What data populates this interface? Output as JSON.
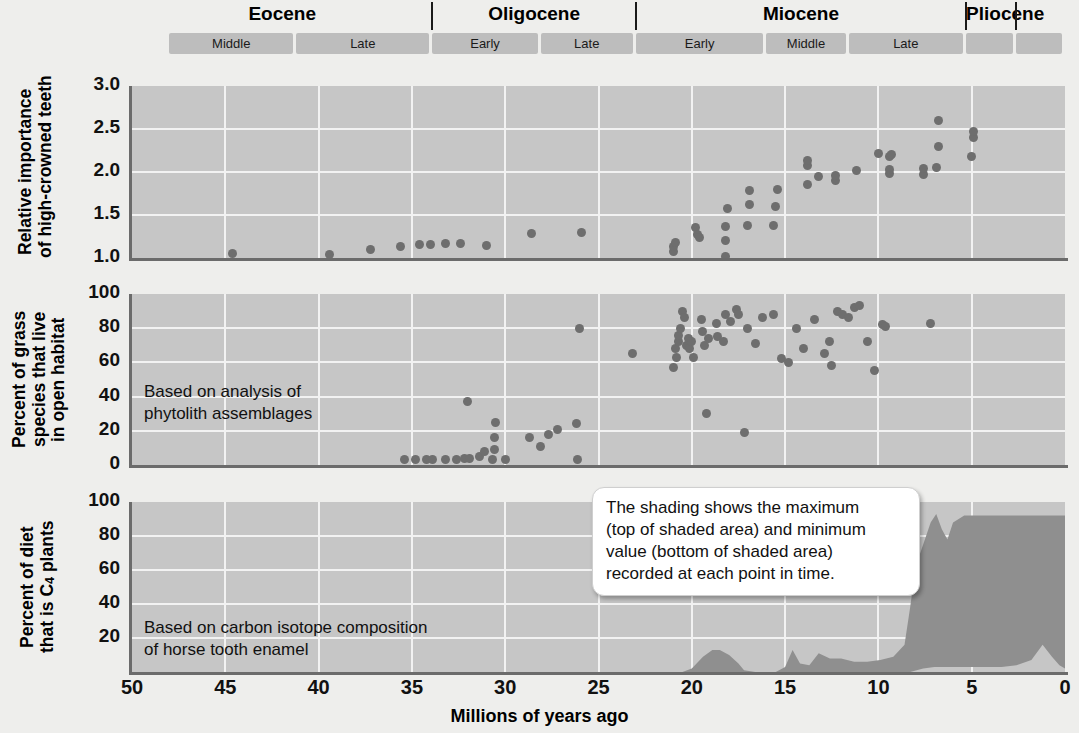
{
  "figure": {
    "x_axis_title": "Millions of years ago",
    "x_ticks": [
      50,
      45,
      40,
      35,
      30,
      25,
      20,
      15,
      10,
      5,
      0
    ],
    "x_range_ma": [
      50,
      0
    ],
    "colors": {
      "panel_fill": "#c6c6c6",
      "grid": "#f2f2f2",
      "dot": "#6e6e6e",
      "area_fill": "#8f8f8f",
      "epoch_band": "#bdbdbd",
      "page_background": "#eeeeec"
    }
  },
  "timescale": {
    "epochs": [
      {
        "name": "Eocene",
        "start_ma": 50,
        "end_ma": 33.9
      },
      {
        "name": "Oligocene",
        "start_ma": 33.9,
        "end_ma": 23.0
      },
      {
        "name": "Miocene",
        "start_ma": 23.0,
        "end_ma": 5.3
      },
      {
        "name": "Pliocene",
        "start_ma": 5.3,
        "end_ma": 2.6
      }
    ],
    "ages": [
      {
        "label": "Middle",
        "start_ma": 48.0,
        "end_ma": 41.2,
        "epoch": "Eocene"
      },
      {
        "label": "Late",
        "start_ma": 41.2,
        "end_ma": 33.9,
        "epoch": "Eocene"
      },
      {
        "label": "Early",
        "start_ma": 33.9,
        "end_ma": 28.1,
        "epoch": "Oligocene"
      },
      {
        "label": "Late",
        "start_ma": 28.1,
        "end_ma": 23.0,
        "epoch": "Oligocene"
      },
      {
        "label": "Early",
        "start_ma": 23.0,
        "end_ma": 16.0,
        "epoch": "Miocene"
      },
      {
        "label": "Middle",
        "start_ma": 16.0,
        "end_ma": 11.6,
        "epoch": "Miocene"
      },
      {
        "label": "Late",
        "start_ma": 11.6,
        "end_ma": 5.3,
        "epoch": "Miocene"
      },
      {
        "label": "",
        "start_ma": 5.3,
        "end_ma": 2.6,
        "epoch": "Pliocene"
      },
      {
        "label": "",
        "start_ma": 2.6,
        "end_ma": 0.0,
        "epoch": "Pleistocene"
      }
    ]
  },
  "panels": [
    {
      "id": "hypsodonty",
      "y_title": "Relative importance\nof high-crowned teeth",
      "y_ticks": [
        "3.0",
        "2.5",
        "2.0",
        "1.5",
        "1.0"
      ],
      "y_values": [
        3.0,
        2.5,
        2.0,
        1.5,
        1.0
      ],
      "y_range": [
        1.0,
        3.0
      ],
      "note": ""
    },
    {
      "id": "open-habitat-grass",
      "y_title": "Percent of grass\nspecies that live\nin open habitat",
      "y_ticks": [
        "100",
        "80",
        "60",
        "40",
        "20",
        "0"
      ],
      "y_values": [
        100,
        80,
        60,
        40,
        20,
        0
      ],
      "y_range": [
        0,
        100
      ],
      "note": "Based on analysis of\nphytolith assemblages"
    },
    {
      "id": "c4-diet",
      "y_title_html": "Percent of diet\nthat is C4 plants",
      "y_ticks": [
        "100",
        "80",
        "60",
        "40",
        "20"
      ],
      "y_values": [
        100,
        80,
        60,
        40,
        20
      ],
      "y_range": [
        0,
        100
      ],
      "note": "Based on carbon isotope composition\nof horse tooth enamel"
    }
  ],
  "callout": {
    "text": "The shading shows the maximum\n(top of shaded area) and minimum\nvalue (bottom of shaded area)\nrecorded at each point in time."
  },
  "chart_data": [
    {
      "type": "scatter",
      "title": "Relative importance of high-crowned teeth",
      "xlabel": "Millions of years ago",
      "ylabel": "Relative importance of high-crowned teeth",
      "xlim": [
        50,
        0
      ],
      "ylim": [
        1.0,
        3.0
      ],
      "grid": true,
      "points": [
        [
          44.6,
          1.05
        ],
        [
          39.4,
          1.04
        ],
        [
          37.2,
          1.1
        ],
        [
          35.6,
          1.13
        ],
        [
          34.6,
          1.16
        ],
        [
          34.0,
          1.16
        ],
        [
          33.2,
          1.17
        ],
        [
          32.4,
          1.17
        ],
        [
          31.0,
          1.14
        ],
        [
          28.6,
          1.28
        ],
        [
          25.9,
          1.3
        ],
        [
          21.0,
          1.08
        ],
        [
          21.0,
          1.13
        ],
        [
          20.9,
          1.18
        ],
        [
          19.8,
          1.35
        ],
        [
          19.7,
          1.27
        ],
        [
          19.6,
          1.24
        ],
        [
          18.2,
          1.02
        ],
        [
          18.2,
          1.2
        ],
        [
          18.2,
          1.37
        ],
        [
          18.1,
          1.58
        ],
        [
          17.0,
          1.38
        ],
        [
          16.9,
          1.62
        ],
        [
          16.9,
          1.78
        ],
        [
          15.6,
          1.38
        ],
        [
          15.5,
          1.6
        ],
        [
          15.4,
          1.8
        ],
        [
          13.8,
          1.85
        ],
        [
          13.8,
          2.08
        ],
        [
          13.8,
          2.13
        ],
        [
          13.2,
          1.95
        ],
        [
          12.3,
          1.9
        ],
        [
          12.3,
          1.96
        ],
        [
          11.2,
          2.02
        ],
        [
          10.0,
          2.22
        ],
        [
          9.4,
          1.98
        ],
        [
          9.4,
          2.03
        ],
        [
          9.4,
          2.18
        ],
        [
          9.3,
          2.2
        ],
        [
          7.6,
          1.97
        ],
        [
          7.6,
          2.04
        ],
        [
          6.9,
          2.05
        ],
        [
          6.8,
          2.3
        ],
        [
          6.8,
          2.6
        ],
        [
          5.0,
          2.18
        ],
        [
          4.9,
          2.4
        ],
        [
          4.9,
          2.47
        ]
      ]
    },
    {
      "type": "scatter",
      "title": "Percent of grass species that live in open habitat",
      "xlabel": "Millions of years ago",
      "ylabel": "Percent of grass species that live in open habitat",
      "xlim": [
        50,
        0
      ],
      "ylim": [
        0,
        100
      ],
      "grid": true,
      "annotation": "Based on analysis of phytolith assemblages",
      "points": [
        [
          35.4,
          3
        ],
        [
          34.8,
          3
        ],
        [
          34.2,
          3
        ],
        [
          33.9,
          3
        ],
        [
          33.2,
          3
        ],
        [
          32.6,
          3
        ],
        [
          32.2,
          4
        ],
        [
          31.9,
          4
        ],
        [
          31.4,
          5
        ],
        [
          31.1,
          8
        ],
        [
          32.0,
          37
        ],
        [
          30.7,
          3
        ],
        [
          30.6,
          9
        ],
        [
          30.6,
          16
        ],
        [
          30.5,
          25
        ],
        [
          30.0,
          3
        ],
        [
          28.7,
          16
        ],
        [
          28.1,
          11
        ],
        [
          27.7,
          18
        ],
        [
          27.2,
          21
        ],
        [
          26.2,
          24
        ],
        [
          26.1,
          3
        ],
        [
          26.0,
          80
        ],
        [
          23.2,
          65
        ],
        [
          21.0,
          57
        ],
        [
          20.9,
          68
        ],
        [
          20.8,
          63
        ],
        [
          20.7,
          72
        ],
        [
          20.7,
          76
        ],
        [
          20.6,
          80
        ],
        [
          20.5,
          90
        ],
        [
          20.4,
          86
        ],
        [
          20.3,
          70
        ],
        [
          20.2,
          74
        ],
        [
          20.1,
          68
        ],
        [
          20.0,
          72
        ],
        [
          19.9,
          63
        ],
        [
          19.5,
          85
        ],
        [
          19.4,
          78
        ],
        [
          19.3,
          70
        ],
        [
          19.2,
          30
        ],
        [
          19.1,
          74
        ],
        [
          18.7,
          83
        ],
        [
          18.6,
          75
        ],
        [
          18.3,
          72
        ],
        [
          18.2,
          88
        ],
        [
          17.9,
          84
        ],
        [
          17.6,
          91
        ],
        [
          17.5,
          88
        ],
        [
          17.2,
          19
        ],
        [
          17.0,
          80
        ],
        [
          16.6,
          71
        ],
        [
          16.2,
          86
        ],
        [
          15.6,
          88
        ],
        [
          15.2,
          62
        ],
        [
          14.8,
          60
        ],
        [
          14.4,
          80
        ],
        [
          14.0,
          68
        ],
        [
          13.4,
          85
        ],
        [
          12.9,
          65
        ],
        [
          12.6,
          72
        ],
        [
          12.5,
          58
        ],
        [
          12.2,
          90
        ],
        [
          11.9,
          88
        ],
        [
          11.6,
          86
        ],
        [
          11.3,
          92
        ],
        [
          11.0,
          93
        ],
        [
          10.6,
          72
        ],
        [
          10.2,
          55
        ],
        [
          9.8,
          82
        ],
        [
          9.6,
          81
        ],
        [
          7.2,
          83
        ]
      ]
    },
    {
      "type": "area",
      "title": "Percent of diet that is C4 plants",
      "xlabel": "Millions of years ago",
      "ylabel": "Percent of diet that is C4 plants",
      "xlim": [
        50,
        0
      ],
      "ylim": [
        0,
        100
      ],
      "grid": true,
      "annotation": "Based on carbon isotope composition of horse tooth enamel",
      "note": "Shading shows maximum (top) and minimum (bottom) value recorded at each point in time.",
      "max_series": [
        [
          21.5,
          0
        ],
        [
          20.5,
          0
        ],
        [
          20.0,
          2
        ],
        [
          19.4,
          9
        ],
        [
          18.9,
          13
        ],
        [
          18.5,
          13
        ],
        [
          18.0,
          10
        ],
        [
          17.5,
          5
        ],
        [
          17.2,
          1
        ],
        [
          16.6,
          0
        ],
        [
          15.5,
          0
        ],
        [
          15.0,
          3
        ],
        [
          14.6,
          13
        ],
        [
          14.2,
          5
        ],
        [
          13.7,
          4
        ],
        [
          13.2,
          11
        ],
        [
          12.6,
          8
        ],
        [
          12.0,
          8
        ],
        [
          11.3,
          6
        ],
        [
          10.6,
          6
        ],
        [
          9.9,
          7
        ],
        [
          9.2,
          9
        ],
        [
          8.6,
          16
        ],
        [
          8.3,
          38
        ],
        [
          8.0,
          62
        ],
        [
          7.6,
          75
        ],
        [
          7.2,
          88
        ],
        [
          6.9,
          93
        ],
        [
          6.6,
          84
        ],
        [
          6.3,
          78
        ],
        [
          6.0,
          88
        ],
        [
          5.4,
          92
        ],
        [
          4.6,
          92
        ],
        [
          3.4,
          92
        ],
        [
          2.6,
          92
        ],
        [
          1.6,
          92
        ],
        [
          0.9,
          92
        ],
        [
          0.0,
          92
        ]
      ],
      "min_series": [
        [
          21.5,
          0
        ],
        [
          16.6,
          0
        ],
        [
          15.5,
          0
        ],
        [
          12.0,
          0
        ],
        [
          9.2,
          0
        ],
        [
          8.3,
          0
        ],
        [
          7.6,
          2
        ],
        [
          7.0,
          3
        ],
        [
          6.3,
          3
        ],
        [
          5.4,
          3
        ],
        [
          4.6,
          3
        ],
        [
          3.4,
          3
        ],
        [
          2.6,
          4
        ],
        [
          1.8,
          7
        ],
        [
          1.2,
          16
        ],
        [
          0.7,
          9
        ],
        [
          0.3,
          4
        ],
        [
          0.0,
          2
        ]
      ]
    }
  ]
}
